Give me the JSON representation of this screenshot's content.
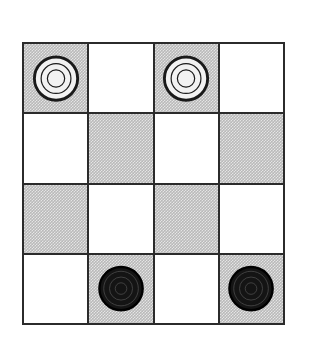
{
  "figure": {
    "name": "checkers-board",
    "kind": "board-diagram",
    "rows": 4,
    "columns": 4,
    "background_color": "#ffffff"
  },
  "board": {
    "border_color": "#2b2b2b",
    "grid_line_color": "#2b2b2b",
    "square_colors": {
      "light": "#ffffff",
      "dark": "#b9b9b9"
    },
    "squares": [
      [
        {
          "shade": "dark",
          "piece": "light-piece"
        },
        {
          "shade": "light",
          "piece": null
        },
        {
          "shade": "dark",
          "piece": "light-piece"
        },
        {
          "shade": "light",
          "piece": null
        }
      ],
      [
        {
          "shade": "light",
          "piece": null
        },
        {
          "shade": "dark",
          "piece": null
        },
        {
          "shade": "light",
          "piece": null
        },
        {
          "shade": "dark",
          "piece": null
        }
      ],
      [
        {
          "shade": "dark",
          "piece": null
        },
        {
          "shade": "light",
          "piece": null
        },
        {
          "shade": "dark",
          "piece": null
        },
        {
          "shade": "light",
          "piece": null
        }
      ],
      [
        {
          "shade": "light",
          "piece": null
        },
        {
          "shade": "dark",
          "piece": "dark-piece"
        },
        {
          "shade": "light",
          "piece": null
        },
        {
          "shade": "dark",
          "piece": "dark-piece"
        }
      ]
    ]
  },
  "pieces": {
    "light-piece": {
      "label": "light checker",
      "fill_color": "#f2f2f2",
      "outline_color": "#1a1a1a",
      "ring_color": "#1a1a1a",
      "rings": 3
    },
    "dark-piece": {
      "label": "dark checker",
      "fill_color": "#141414",
      "outline_color": "#000000",
      "ring_color": "#4a4a4a",
      "rings": 3
    }
  }
}
